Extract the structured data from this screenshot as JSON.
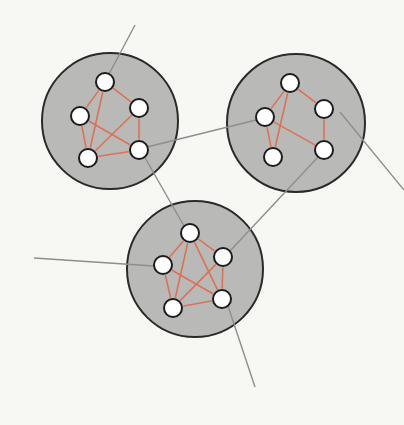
{
  "diagram": {
    "title": "",
    "colors": {
      "background": "#f7f7f4",
      "cluster_fill": "#b9b9b7",
      "cluster_stroke": "#2a2a2a",
      "intra_edge": "#e06a4c",
      "inter_link": "#8e8e8e",
      "node_fill": "#ffffff",
      "node_stroke": "#1c1c1c"
    },
    "node_radius": 9,
    "clusters": [
      {
        "id": "cluster-top-left",
        "cx": 110,
        "cy": 121,
        "r": 68,
        "nodes": {
          "T": [
            105,
            82
          ],
          "R": [
            139,
            108
          ],
          "L": [
            80,
            116
          ],
          "BR": [
            139,
            150
          ],
          "BL": [
            88,
            158
          ]
        },
        "edges": [
          [
            "T",
            "R"
          ],
          [
            "T",
            "L"
          ],
          [
            "T",
            "BL"
          ],
          [
            "L",
            "BL"
          ],
          [
            "L",
            "BR"
          ],
          [
            "R",
            "BR"
          ],
          [
            "R",
            "BL"
          ],
          [
            "BL",
            "BR"
          ]
        ]
      },
      {
        "id": "cluster-top-right",
        "cx": 296,
        "cy": 123,
        "r": 69,
        "nodes": {
          "T": [
            290,
            83
          ],
          "R": [
            324,
            109
          ],
          "L": [
            265,
            117
          ],
          "BR": [
            324,
            150
          ],
          "BL": [
            273,
            157
          ]
        },
        "edges": [
          [
            "T",
            "R"
          ],
          [
            "T",
            "L"
          ],
          [
            "T",
            "BL"
          ],
          [
            "L",
            "BL"
          ],
          [
            "L",
            "BR"
          ],
          [
            "R",
            "BR"
          ]
        ]
      },
      {
        "id": "cluster-bottom",
        "cx": 195,
        "cy": 269,
        "r": 68,
        "nodes": {
          "T": [
            190,
            233
          ],
          "R": [
            223,
            257
          ],
          "L": [
            163,
            265
          ],
          "BR": [
            222,
            299
          ],
          "BL": [
            173,
            308
          ]
        },
        "edges": [
          [
            "T",
            "R"
          ],
          [
            "T",
            "L"
          ],
          [
            "T",
            "BL"
          ],
          [
            "T",
            "BR"
          ],
          [
            "L",
            "BL"
          ],
          [
            "L",
            "BR"
          ],
          [
            "R",
            "BR"
          ],
          [
            "R",
            "BL"
          ],
          [
            "BL",
            "BR"
          ]
        ]
      }
    ],
    "links": [
      {
        "id": "external-top",
        "from": [
          135,
          25
        ],
        "to": [
          108,
          76
        ]
      },
      {
        "id": "cluster1-to-cluster2",
        "from": [
          147,
          147
        ],
        "to": [
          256,
          120
        ]
      },
      {
        "id": "cluster1-to-cluster3",
        "from": [
          144,
          156
        ],
        "to": [
          184,
          226
        ]
      },
      {
        "id": "cluster2-to-cluster3",
        "from": [
          318,
          157
        ],
        "to": [
          230,
          251
        ]
      },
      {
        "id": "external-right",
        "from": [
          340,
          112
        ],
        "to": [
          404,
          190
        ]
      },
      {
        "id": "external-left",
        "from": [
          34,
          258
        ],
        "to": [
          154,
          266
        ]
      },
      {
        "id": "external-bottom",
        "from": [
          228,
          306
        ],
        "to": [
          255,
          387
        ]
      }
    ]
  }
}
